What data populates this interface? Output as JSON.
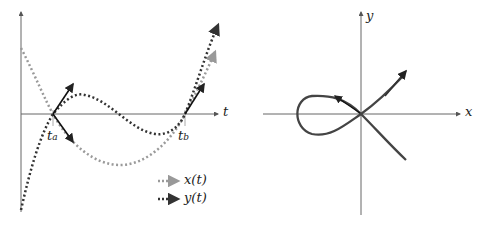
{
  "left_plot": {
    "axis_label_t": "t",
    "tick_a": {
      "base": "t",
      "sub": "a"
    },
    "tick_b": {
      "base": "t",
      "sub": "b"
    },
    "legend": [
      {
        "label": "x(t)",
        "color": "#9a9a9a",
        "style": "dotted"
      },
      {
        "label": "y(t)",
        "color": "#333333",
        "style": "dotted"
      }
    ]
  },
  "right_plot": {
    "axis_label_x": "x",
    "axis_label_y": "y",
    "curve_color": "#444444"
  }
}
